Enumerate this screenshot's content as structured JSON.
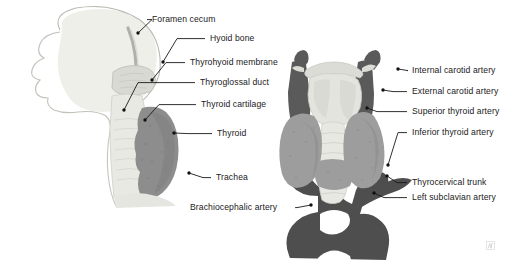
{
  "figure": {
    "background_color": "#ffffff",
    "leader_color": "#1a1a1a",
    "palette": {
      "artery_dark": "#4e4e4e",
      "artery_mid": "#5a5a5a",
      "thyroid_gray": "#9a9a9a",
      "thyroid_sagittal": "#8a8a8a",
      "cartilage_light": "#d9d9d4",
      "cartilage_pale": "#e7e7e2",
      "skull_pale": "#efefea",
      "outline": "#b5b5ae"
    }
  },
  "labels": {
    "left": [
      {
        "id": "foramen-cecum",
        "text": "Foramen cecum",
        "x": 152,
        "y": 14,
        "dot_x": 138,
        "dot_y": 33
      },
      {
        "id": "hyoid-bone",
        "text": "Hyoid bone",
        "x": 210,
        "y": 33,
        "dot_x": 163,
        "dot_y": 62
      },
      {
        "id": "thyrohyoid-membrane",
        "text": "Thyrohyoid membrane",
        "x": 190,
        "y": 57,
        "dot_x": 152,
        "dot_y": 80
      },
      {
        "id": "thyroglossal-duct",
        "text": "Thyroglossal duct",
        "x": 200,
        "y": 77,
        "dot_x": 124,
        "dot_y": 110
      },
      {
        "id": "thyroid-cartilage",
        "text": "Thyroid cartilage",
        "x": 201,
        "y": 99,
        "dot_x": 145,
        "dot_y": 120
      },
      {
        "id": "thyroid",
        "text": "Thyroid",
        "x": 217,
        "y": 128,
        "dot_x": 174,
        "dot_y": 133
      },
      {
        "id": "trachea",
        "text": "Trachea",
        "x": 216,
        "y": 172,
        "dot_x": 189,
        "dot_y": 173
      },
      {
        "id": "brachiocephalic",
        "text": "Brachiocephalic artery",
        "x": 190,
        "y": 202,
        "dot_x": 311,
        "dot_y": 205
      }
    ],
    "right": [
      {
        "id": "internal-carotid",
        "text": "Internal carotid artery",
        "x": 412,
        "y": 65,
        "dot_x": 398,
        "dot_y": 69
      },
      {
        "id": "external-carotid",
        "text": "External carotid artery",
        "x": 412,
        "y": 86,
        "dot_x": 383,
        "dot_y": 90
      },
      {
        "id": "superior-thyroid",
        "text": "Superior thyroid artery",
        "x": 412,
        "y": 106,
        "dot_x": 367,
        "dot_y": 108
      },
      {
        "id": "inferior-thyroid",
        "text": "Inferior thyroid artery",
        "x": 412,
        "y": 127,
        "dot_x": 388,
        "dot_y": 165
      },
      {
        "id": "thyrocervical-trunk",
        "text": "Thyrocervical trunk",
        "x": 412,
        "y": 177,
        "dot_x": 387,
        "dot_y": 176
      },
      {
        "id": "left-subclavian",
        "text": "Left subclavian artery",
        "x": 412,
        "y": 192,
        "dot_x": 374,
        "dot_y": 193
      }
    ]
  },
  "watermark": {
    "present": true,
    "name": "image-watermark"
  }
}
